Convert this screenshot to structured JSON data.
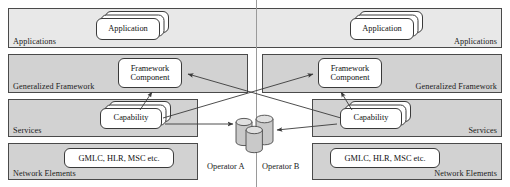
{
  "diagram": {
    "divider_name": "operator-divider",
    "colors": {
      "band_fill": "#d2d2d2",
      "band_dotted_fill": "#e8e8e8",
      "band_border": "#4a4a4a",
      "card_fill": "#ffffff",
      "card_border": "#3a3a3a",
      "arrow": "#3a3a3a",
      "cylinder_fill": "#c9c9c9",
      "cylinder_top": "#dedede",
      "divider": "#9a9a9a"
    }
  },
  "layers": [
    {
      "id": "applications",
      "label_left": "Applications",
      "label_right": "Applications",
      "pattern": "dotted"
    },
    {
      "id": "generalized-framework",
      "label_left": "Generalized Framework",
      "label_right": "Generalized Framework",
      "pattern": "solid"
    },
    {
      "id": "services",
      "label_left": "Services",
      "label_right": "Services",
      "pattern": "solid"
    },
    {
      "id": "network-elements",
      "label_left": "Network Elements",
      "label_right": "Network Elements",
      "pattern": "solid"
    }
  ],
  "cards": {
    "application_left": "Application",
    "application_right": "Application",
    "framework_component_left": "Framework Component",
    "framework_component_right": "Framework Component",
    "capability_left": "Capability",
    "capability_right": "Capability",
    "network_elements_left": "GMLC, HLR, MSC etc.",
    "network_elements_right": "GMLC, HLR, MSC etc."
  },
  "operators": {
    "left": "Operator A",
    "right": "Operator B"
  },
  "datastore": {
    "name": "shared-database-cluster",
    "count": 3
  }
}
